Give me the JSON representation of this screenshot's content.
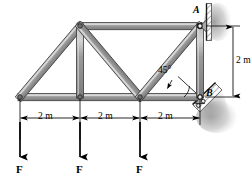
{
  "figure": {
    "name": "truss-free-body-diagram",
    "type": "engineering-statics-truss"
  },
  "colors": {
    "member_fill": "#8f8f8f",
    "member_highlight": "#c9c9c9",
    "member_outline": "#3a3a3a",
    "line": "#000000",
    "hatch": "#9a9a9a",
    "wall_plate": "#b5b5b5",
    "background": "#ffffff"
  },
  "supports": {
    "pin": {
      "label": "A",
      "kind": "pin-support-wall",
      "x": 200,
      "y": 26
    },
    "roller": {
      "label": "B",
      "kind": "inclined-roller-support",
      "x": 200,
      "y": 97,
      "incline_deg": 45
    }
  },
  "angle_annotation": {
    "label": "45°",
    "value": 45,
    "unit": "deg"
  },
  "dimensions": {
    "horizontal": [
      {
        "label": "2 m",
        "value": 2,
        "unit": "m",
        "from_x": 20,
        "to_x": 80
      },
      {
        "label": "2 m",
        "value": 2,
        "unit": "m",
        "from_x": 80,
        "to_x": 140
      },
      {
        "label": "2 m",
        "value": 2,
        "unit": "m",
        "from_x": 140,
        "to_x": 200
      }
    ],
    "vertical": [
      {
        "label": "2 m",
        "value": 2,
        "unit": "m",
        "from_y": 26,
        "to_y": 97
      }
    ]
  },
  "loads": [
    {
      "label": "F",
      "x": 20,
      "direction": "down"
    },
    {
      "label": "F",
      "x": 80,
      "direction": "down"
    },
    {
      "label": "F",
      "x": 140,
      "direction": "down"
    }
  ],
  "geometry": {
    "joints": {
      "bottom_left": {
        "x": 20,
        "y": 97
      },
      "bottom_mid1": {
        "x": 80,
        "y": 97
      },
      "bottom_mid2": {
        "x": 140,
        "y": 97
      },
      "bottom_right": {
        "x": 200,
        "y": 97
      },
      "top_left": {
        "x": 80,
        "y": 26
      },
      "top_right": {
        "x": 200,
        "y": 26
      }
    },
    "members": [
      {
        "name": "bottom-chord-1",
        "from": "bottom_left",
        "to": "bottom_mid1"
      },
      {
        "name": "bottom-chord-2",
        "from": "bottom_mid1",
        "to": "bottom_mid2"
      },
      {
        "name": "bottom-chord-3",
        "from": "bottom_mid2",
        "to": "bottom_right"
      },
      {
        "name": "top-chord",
        "from": "top_left",
        "to": "top_right"
      },
      {
        "name": "left-diagonal",
        "from": "bottom_left",
        "to": "top_left"
      },
      {
        "name": "vertical-mid1",
        "from": "bottom_mid1",
        "to": "top_left"
      },
      {
        "name": "diagonal-1",
        "from": "bottom_mid2",
        "to": "top_left"
      },
      {
        "name": "diagonal-2",
        "from": "bottom_mid2",
        "to": "top_right"
      },
      {
        "name": "right-vertical",
        "from": "bottom_right",
        "to": "top_right"
      }
    ]
  }
}
